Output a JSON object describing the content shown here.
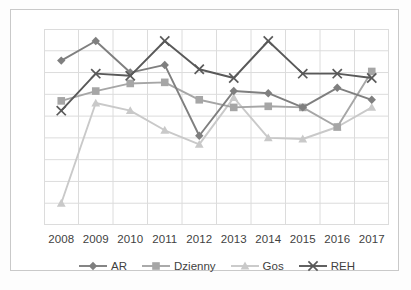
{
  "chart_data": {
    "type": "line",
    "title": "",
    "xlabel": "",
    "ylabel": "",
    "grid": true,
    "legend_position": "bottom",
    "categories": [
      "2008",
      "2009",
      "2010",
      "2011",
      "2012",
      "2013",
      "2014",
      "2015",
      "2016",
      "2017"
    ],
    "ylim": [
      0,
      9
    ],
    "yticks": [
      0,
      1,
      2,
      3,
      4,
      5,
      6,
      7,
      8,
      9
    ],
    "yticklabels_visible": false,
    "series": [
      {
        "name": "AR",
        "marker": "diamond",
        "color": "#7f7f7f",
        "values": [
          7.55,
          8.45,
          7.0,
          7.35,
          4.1,
          6.15,
          6.05,
          5.4,
          6.3,
          5.75
        ]
      },
      {
        "name": "Dzienny",
        "marker": "square",
        "color": "#a6a6a6",
        "values": [
          5.7,
          6.15,
          6.5,
          6.55,
          5.75,
          5.4,
          5.45,
          5.4,
          4.5,
          7.05
        ]
      },
      {
        "name": "Gos",
        "marker": "triangle",
        "color": "#c9c9c9",
        "values": [
          1.0,
          5.6,
          5.25,
          4.35,
          3.7,
          5.85,
          4.0,
          3.95,
          4.5,
          5.4
        ]
      },
      {
        "name": "REH",
        "marker": "x",
        "color": "#595959",
        "values": [
          5.25,
          6.95,
          6.85,
          8.45,
          7.15,
          6.75,
          8.45,
          6.95,
          6.95,
          6.75
        ]
      }
    ]
  },
  "axis": {
    "tick_labels": [
      "2008",
      "2009",
      "2010",
      "2011",
      "2012",
      "2013",
      "2014",
      "2015",
      "2016",
      "2017"
    ]
  },
  "legend": {
    "items": [
      {
        "label": "AR",
        "marker": "diamond-marker",
        "color": "#7f7f7f"
      },
      {
        "label": "Dzienny",
        "marker": "square-marker",
        "color": "#a6a6a6"
      },
      {
        "label": "Gos",
        "marker": "triangle-marker",
        "color": "#c9c9c9"
      },
      {
        "label": "REH",
        "marker": "x-marker",
        "color": "#595959"
      }
    ]
  },
  "style": {
    "grid_color": "#dcdcdc",
    "border_color": "#c9c9c9",
    "text_color": "#3f3f3f",
    "background": "#ffffff"
  }
}
